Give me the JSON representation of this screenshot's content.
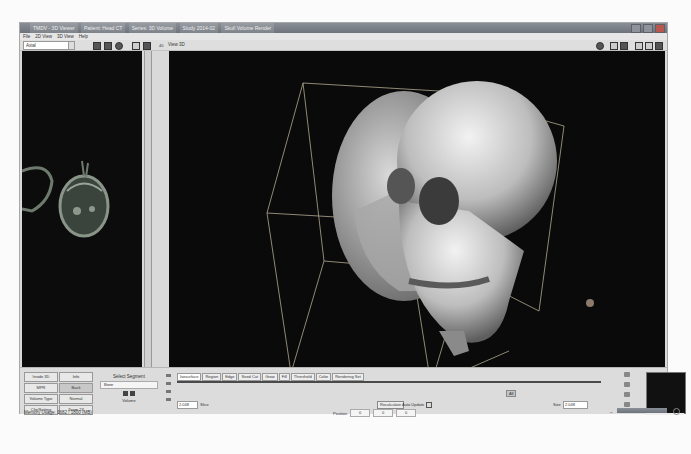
{
  "window": {
    "title_segments": [
      "TMDV - 3D Viewer",
      "Patient: Head CT",
      "Series: 3D Volume",
      "Study 2014-02",
      "Skull Volume Render"
    ]
  },
  "menu": [
    "File",
    "2D View",
    "3D View",
    "Help"
  ],
  "toolbar": {
    "layout_combo": "Axial",
    "view_label": "View 3D",
    "left_zoom": "40"
  },
  "left_panel": {
    "description": "Axial CT slice of head"
  },
  "main_view": {
    "description": "3D volume rendering of skull with bounding box"
  },
  "bottom": {
    "grid_buttons": [
      {
        "label": "Inside 3D",
        "active": false
      },
      {
        "label": "Info",
        "active": false
      },
      {
        "label": "MPR",
        "active": false
      },
      {
        "label": "Back",
        "active": true
      },
      {
        "label": "Volume Type",
        "active": false
      },
      {
        "label": "Normal",
        "active": false
      },
      {
        "label": "Clip/Setting",
        "active": false
      },
      {
        "label": "Zoom 2X",
        "active": false
      }
    ],
    "status_text": "Memory Usage: 1682 / 1800 (MB)",
    "section_title": "Select Segment",
    "section_input": "Bone",
    "section_footer": "Volume",
    "tabs": [
      "Isosurface",
      "Region",
      "Edge",
      "Seed Cut",
      "Grow",
      "Fill",
      "Threshold",
      "Color",
      "Rendering Set"
    ],
    "value_field": "2.048",
    "unit": "Slice",
    "reset_label": "Recalculate",
    "auto_update_label": "Auto Update",
    "mid_button": "All",
    "size_label": "Size",
    "size_value": "2.048",
    "coords_label": "Position",
    "coords": [
      "0",
      "0",
      "0"
    ]
  }
}
